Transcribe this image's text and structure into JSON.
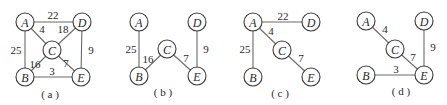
{
  "figure": {
    "panels": [
      {
        "caption": "( a )",
        "offset_x": 0,
        "nodes": [
          {
            "id": "A",
            "label": "A",
            "x": 25,
            "y": 22
          },
          {
            "id": "D",
            "label": "D",
            "x": 82,
            "y": 22
          },
          {
            "id": "C",
            "label": "C",
            "x": 52,
            "y": 50
          },
          {
            "id": "B",
            "label": "B",
            "x": 25,
            "y": 77
          },
          {
            "id": "E",
            "label": "E",
            "x": 81,
            "y": 77
          }
        ],
        "edges": [
          {
            "from": "A",
            "to": "D",
            "weight": "22",
            "lx": 53,
            "ly": 15
          },
          {
            "from": "A",
            "to": "C",
            "weight": "4",
            "lx": 42,
            "ly": 29
          },
          {
            "from": "C",
            "to": "D",
            "weight": "18",
            "lx": 63,
            "ly": 29
          },
          {
            "from": "A",
            "to": "B",
            "weight": "25",
            "lx": 16,
            "ly": 50
          },
          {
            "from": "D",
            "to": "E",
            "weight": "9",
            "lx": 91,
            "ly": 50
          },
          {
            "from": "B",
            "to": "C",
            "weight": "16",
            "lx": 35,
            "ly": 64
          },
          {
            "from": "C",
            "to": "E",
            "weight": "7",
            "lx": 66,
            "ly": 63
          },
          {
            "from": "B",
            "to": "E",
            "weight": "3",
            "lx": 52,
            "ly": 71
          }
        ],
        "caption_x": 50,
        "caption_y": 94
      },
      {
        "caption": "( b )",
        "offset_x": 0,
        "nodes": [
          {
            "id": "A",
            "label": "A",
            "x": 139,
            "y": 22
          },
          {
            "id": "D",
            "label": "D",
            "x": 197,
            "y": 22
          },
          {
            "id": "C",
            "label": "C",
            "x": 167,
            "y": 49
          },
          {
            "id": "B",
            "label": "B",
            "x": 139,
            "y": 76
          },
          {
            "id": "E",
            "label": "E",
            "x": 197,
            "y": 76
          }
        ],
        "edges": [
          {
            "from": "A",
            "to": "B",
            "weight": "25",
            "lx": 131,
            "ly": 49
          },
          {
            "from": "D",
            "to": "E",
            "weight": "9",
            "lx": 206,
            "ly": 49
          },
          {
            "from": "B",
            "to": "C",
            "weight": "16",
            "lx": 148,
            "ly": 59
          },
          {
            "from": "C",
            "to": "E",
            "weight": "7",
            "lx": 186,
            "ly": 58
          }
        ],
        "caption_x": 163,
        "caption_y": 92
      },
      {
        "caption": "( c )",
        "offset_x": 0,
        "nodes": [
          {
            "id": "A",
            "label": "A",
            "x": 253,
            "y": 22
          },
          {
            "id": "D",
            "label": "D",
            "x": 311,
            "y": 22
          },
          {
            "id": "C",
            "label": "C",
            "x": 282,
            "y": 50
          },
          {
            "id": "B",
            "label": "B",
            "x": 253,
            "y": 77
          },
          {
            "id": "E",
            "label": "E",
            "x": 311,
            "y": 77
          }
        ],
        "edges": [
          {
            "from": "A",
            "to": "D",
            "weight": "22",
            "lx": 283,
            "ly": 16
          },
          {
            "from": "A",
            "to": "C",
            "weight": "4",
            "lx": 271,
            "ly": 31
          },
          {
            "from": "A",
            "to": "B",
            "weight": "25",
            "lx": 245,
            "ly": 49
          },
          {
            "from": "C",
            "to": "E",
            "weight": "7",
            "lx": 301,
            "ly": 58
          }
        ],
        "caption_x": 280,
        "caption_y": 93
      },
      {
        "caption": "( d )",
        "offset_x": 0,
        "nodes": [
          {
            "id": "A",
            "label": "A",
            "x": 366,
            "y": 21
          },
          {
            "id": "D",
            "label": "D",
            "x": 424,
            "y": 21
          },
          {
            "id": "C",
            "label": "C",
            "x": 395,
            "y": 49
          },
          {
            "id": "B",
            "label": "B",
            "x": 366,
            "y": 75
          },
          {
            "id": "E",
            "label": "E",
            "x": 424,
            "y": 75
          }
        ],
        "edges": [
          {
            "from": "A",
            "to": "C",
            "weight": "4",
            "lx": 385,
            "ly": 29
          },
          {
            "from": "D",
            "to": "E",
            "weight": "9",
            "lx": 433,
            "ly": 47
          },
          {
            "from": "C",
            "to": "E",
            "weight": "7",
            "lx": 413,
            "ly": 57
          },
          {
            "from": "B",
            "to": "E",
            "weight": "3",
            "lx": 396,
            "ly": 69
          }
        ],
        "caption_x": 401,
        "caption_y": 91
      }
    ],
    "node_radius": 9,
    "colors": {
      "edge": "#6b6b6b",
      "node_stroke": "#3a3a3a",
      "text": "#2a2a2a",
      "background": "#ffffff"
    }
  }
}
